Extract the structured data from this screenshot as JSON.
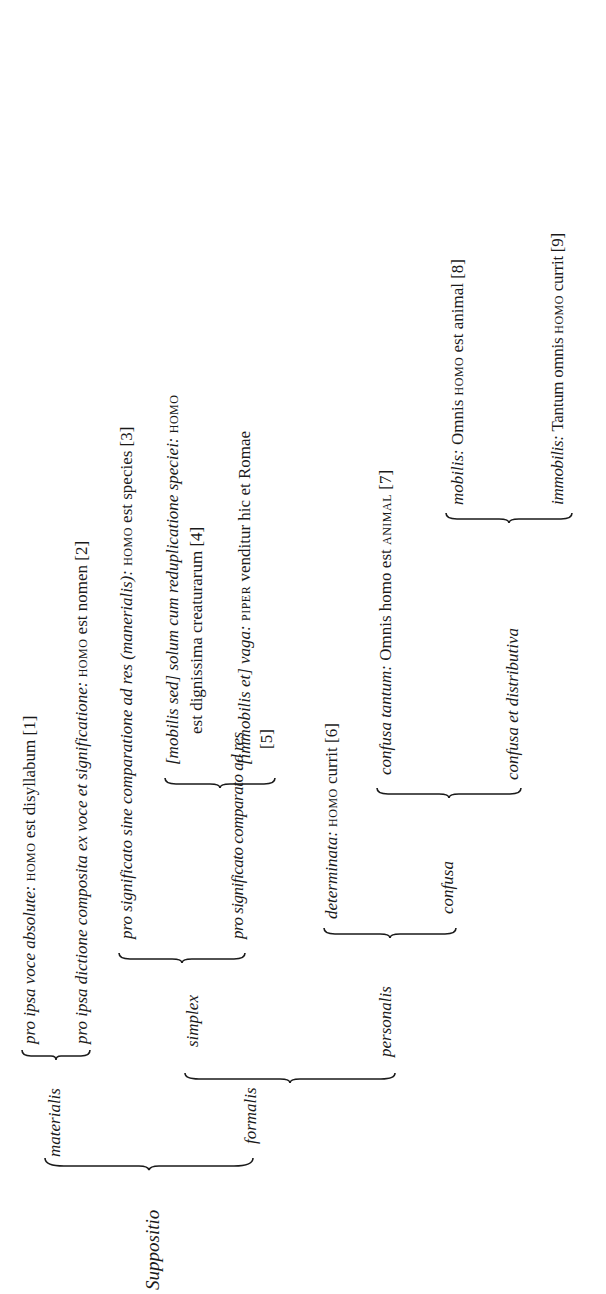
{
  "root": "Suppositio",
  "materialis": {
    "label": "materialis",
    "items": [
      {
        "label": "pro ipsa voce absolute:",
        "example_sc": "homo",
        "example": "est disyllabum",
        "ref": "[1]"
      },
      {
        "label": "pro ipsa dictione composita ex voce et significatione:",
        "example_sc": "homo",
        "example": "est nomen",
        "ref": "[2]"
      }
    ]
  },
  "formalis": {
    "label": "formalis",
    "simplex": {
      "label": "simplex",
      "sine": {
        "label": "pro significato sine comparatione ad res",
        "paren": "(manerialis):",
        "example_sc": "homo",
        "example": "est species",
        "ref": "[3]"
      },
      "comparato": {
        "label": "pro significato comparato ad res",
        "mobilis": {
          "label": "[mobilis sed] solum cum reduplicatione speciei:",
          "example_sc": "homo",
          "example_line2": "est dignissima creaturarum",
          "ref": "[4]"
        },
        "immobilis": {
          "label": "[immobilis et] vaga:",
          "example_sc": "piper",
          "example": "venditur hic et Romae",
          "ref": "[5]"
        }
      }
    },
    "personalis": {
      "label": "personalis",
      "determinata": {
        "label": "determinata:",
        "example_sc": "homo",
        "example": "currit",
        "ref": "[6]"
      },
      "confusa": {
        "label": "confusa",
        "tantum": {
          "label": "confusa tantum:",
          "example": "Omnis homo est",
          "example_sc": "animal",
          "ref": "[7]"
        },
        "distributiva": {
          "label": "confusa et distributiva",
          "mobilis": {
            "label": "mobilis:",
            "example_pre": "Omnis",
            "example_sc": "homo",
            "example": "est animal",
            "ref": "[8]"
          },
          "immobilis": {
            "label": "immobilis:",
            "example_pre": "Tantum omnis",
            "example_sc": "homo",
            "example": "currit",
            "ref": "[9]"
          }
        }
      }
    }
  }
}
